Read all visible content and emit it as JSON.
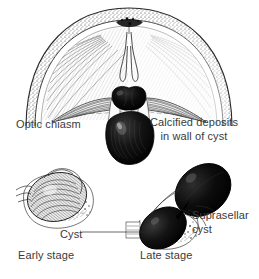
{
  "figure": {
    "background_color": "#ffffff",
    "ink_color": "#1a1a1a",
    "label_color": "#3a3a3a",
    "mass_fill": "#0d0d0d"
  },
  "labels": {
    "optic_chiasm": "Optic chiasm",
    "calcified_deposits_line1": "Calcified deposits",
    "calcified_deposits_line2": "in wall of cyst",
    "cyst": "Cyst",
    "suprasellar_line1": "Suprasellar",
    "suprasellar_line2": "cyst",
    "early_stage": "Early stage",
    "late_stage": "Late stage"
  },
  "panels": [
    {
      "name": "main-coronal-view",
      "caption": "",
      "features": [
        "skull vault arch with stippled calvarium band",
        "hatched cerebral hemispheres",
        "midline infundibulum / pituitary stalk",
        "bilobed dark optic chiasm compressed by mass",
        "large black suprasellar cyst"
      ]
    },
    {
      "name": "early-stage-view",
      "caption": "Early stage",
      "features": [
        "small hatched cyst within sella",
        "sphenoid sinus outline",
        "cyst leader line"
      ]
    },
    {
      "name": "late-stage-view",
      "caption": "Late stage",
      "features": [
        "large bilobed black cyst extending superiorly",
        "sella turcica with sphenoid sinus",
        "suprasellar extension"
      ]
    }
  ]
}
